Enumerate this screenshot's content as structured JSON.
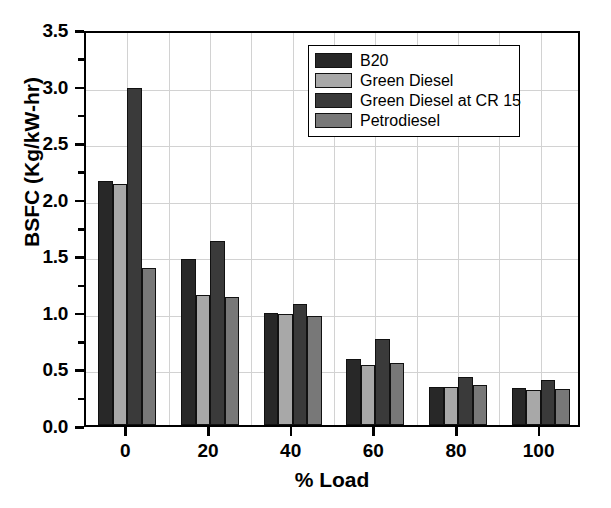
{
  "chart_data": {
    "type": "bar",
    "title": "",
    "xlabel": "% Load",
    "ylabel": "BSFC (Kg/kW-hr)",
    "categories": [
      "0",
      "20",
      "40",
      "60",
      "80",
      "100"
    ],
    "xtick_labels": [
      "0",
      "20",
      "40",
      "60",
      "80",
      "100"
    ],
    "ytick_labels": [
      "0.0",
      "0.5",
      "1.0",
      "1.5",
      "2.0",
      "2.5",
      "3.0",
      "3.5"
    ],
    "ytick_values": [
      0.0,
      0.5,
      1.0,
      1.5,
      2.0,
      2.5,
      3.0,
      3.5
    ],
    "ylim": [
      0.0,
      3.5
    ],
    "xlim": [
      -10,
      110
    ],
    "grid": true,
    "legend_position": "top-right",
    "series": [
      {
        "name": "B20",
        "color": "#282828",
        "values": [
          2.16,
          1.47,
          0.99,
          0.58,
          0.34,
          0.33
        ]
      },
      {
        "name": "Green Diesel",
        "color": "#a8a8a8",
        "values": [
          2.13,
          1.15,
          0.98,
          0.53,
          0.34,
          0.31
        ]
      },
      {
        "name": "Green Diesel at CR 15",
        "color": "#3a3a3a",
        "values": [
          2.98,
          1.63,
          1.07,
          0.76,
          0.42,
          0.4
        ]
      },
      {
        "name": "Petrodiesel",
        "color": "#787878",
        "values": [
          1.39,
          1.13,
          0.96,
          0.55,
          0.35,
          0.32
        ]
      }
    ]
  },
  "style": {
    "axis_color": "#000000",
    "grid_color": "#d2d2d2",
    "background": "#ffffff",
    "bar_edge": "#111111"
  }
}
